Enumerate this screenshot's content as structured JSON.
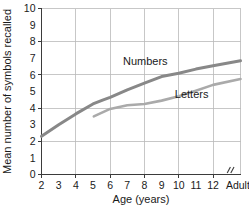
{
  "chart_data": {
    "type": "line",
    "title": "",
    "xlabel": "Age (years)",
    "ylabel": "Mean number of symbols recalled",
    "ylim": [
      0,
      10
    ],
    "ytick_labels": [
      "0",
      "1",
      "2",
      "3",
      "4",
      "5",
      "6",
      "7",
      "8",
      "9",
      "10"
    ],
    "ytick_values": [
      0,
      1,
      2,
      3,
      4,
      5,
      6,
      7,
      8,
      9,
      10
    ],
    "xtick_labels": [
      "2",
      "3",
      "4",
      "5",
      "6",
      "7",
      "8",
      "9",
      "10",
      "11",
      "12",
      "Adults"
    ],
    "xtick_values": [
      2,
      3,
      4,
      5,
      6,
      7,
      8,
      9,
      10,
      11,
      12,
      13.6
    ],
    "grid": "both-every-2-units",
    "grid_x_values": [
      4,
      6,
      8,
      10,
      12
    ],
    "grid_y_values": [
      2,
      4,
      6,
      8,
      10
    ],
    "axis_break": {
      "symbol": "//",
      "between": [
        "12",
        "Adults"
      ],
      "position": 13.0
    },
    "legend_position": "inline-annotations",
    "series": [
      {
        "name": "Numbers",
        "color": "#888888",
        "linewidth": 3.0,
        "label_position": {
          "x": 8.05,
          "y": 6.62
        },
        "x": [
          2,
          3,
          4,
          5,
          5.6,
          6,
          7,
          8,
          9,
          10,
          11,
          12,
          13.6
        ],
        "values": [
          2.3,
          3.0,
          3.65,
          4.25,
          4.5,
          4.65,
          5.1,
          5.5,
          5.9,
          6.1,
          6.35,
          6.55,
          6.85
        ]
      },
      {
        "name": "Letters",
        "color": "#aaaaaa",
        "linewidth": 2.6,
        "label_position": {
          "x": 10.75,
          "y": 4.62
        },
        "x": [
          5.05,
          6,
          7,
          7.4,
          8,
          9,
          10,
          11,
          12,
          13.6
        ],
        "values": [
          3.5,
          3.95,
          4.17,
          4.2,
          4.25,
          4.45,
          4.72,
          5.05,
          5.4,
          5.75
        ]
      }
    ]
  }
}
